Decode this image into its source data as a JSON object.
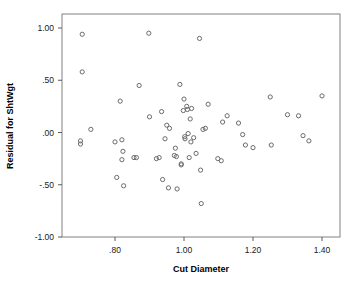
{
  "chart_data": {
    "type": "scatter",
    "title": "",
    "xlabel": "Cut Diameter",
    "ylabel": "Residual for ShtWgt",
    "xlim": [
      0.685,
      1.43
    ],
    "ylim": [
      -1.0,
      1.08
    ],
    "grid": false,
    "legend": null,
    "xticks": [
      0.8,
      1.0,
      1.2,
      1.4
    ],
    "xticklabels": [
      ".80",
      "1.00",
      "1.20",
      "1.40"
    ],
    "yticks": [
      1.0,
      0.5,
      0.0,
      -0.5,
      -1.0
    ],
    "yticklabels": [
      "1.00",
      ".50",
      ".00",
      "-.50",
      "-1.00"
    ],
    "marker": "open-circle",
    "marker_color": "#6b6b6b",
    "points": [
      [
        0.705,
        0.94
      ],
      [
        0.705,
        0.58
      ],
      [
        0.7,
        -0.08
      ],
      [
        0.7,
        -0.11
      ],
      [
        0.73,
        0.03
      ],
      [
        0.8,
        -0.09
      ],
      [
        0.805,
        -0.43
      ],
      [
        0.815,
        0.3
      ],
      [
        0.82,
        -0.07
      ],
      [
        0.82,
        -0.26
      ],
      [
        0.823,
        -0.18
      ],
      [
        0.825,
        -0.51
      ],
      [
        0.855,
        -0.24
      ],
      [
        0.862,
        -0.24
      ],
      [
        0.87,
        0.45
      ],
      [
        0.898,
        0.95
      ],
      [
        0.9,
        0.15
      ],
      [
        0.92,
        -0.25
      ],
      [
        0.928,
        -0.24
      ],
      [
        0.935,
        0.2
      ],
      [
        0.938,
        -0.45
      ],
      [
        0.945,
        -0.06
      ],
      [
        0.95,
        0.07
      ],
      [
        0.955,
        -0.53
      ],
      [
        0.958,
        0.04
      ],
      [
        0.972,
        -0.22
      ],
      [
        0.975,
        -0.15
      ],
      [
        0.978,
        -0.23
      ],
      [
        0.98,
        -0.54
      ],
      [
        0.988,
        0.46
      ],
      [
        0.992,
        -0.3
      ],
      [
        0.992,
        -0.31
      ],
      [
        0.998,
        0.21
      ],
      [
        1.0,
        0.32
      ],
      [
        1.002,
        -0.04
      ],
      [
        1.003,
        -0.06
      ],
      [
        1.008,
        0.25
      ],
      [
        1.01,
        0.22
      ],
      [
        1.012,
        -0.01
      ],
      [
        1.015,
        -0.24
      ],
      [
        1.018,
        0.13
      ],
      [
        1.02,
        -0.09
      ],
      [
        1.022,
        0.23
      ],
      [
        1.028,
        -0.05
      ],
      [
        1.035,
        -0.2
      ],
      [
        1.045,
        0.9
      ],
      [
        1.048,
        -0.36
      ],
      [
        1.05,
        -0.68
      ],
      [
        1.055,
        0.03
      ],
      [
        1.062,
        0.04
      ],
      [
        1.07,
        0.27
      ],
      [
        1.098,
        -0.25
      ],
      [
        1.108,
        -0.27
      ],
      [
        1.112,
        0.1
      ],
      [
        1.125,
        0.16
      ],
      [
        1.158,
        0.09
      ],
      [
        1.17,
        -0.02
      ],
      [
        1.178,
        -0.12
      ],
      [
        1.2,
        -0.145
      ],
      [
        1.25,
        0.34
      ],
      [
        1.253,
        -0.12
      ],
      [
        1.3,
        0.17
      ],
      [
        1.332,
        0.16
      ],
      [
        1.345,
        -0.03
      ],
      [
        1.362,
        -0.08
      ],
      [
        1.4,
        0.35
      ]
    ]
  },
  "chart": {
    "xlabel": "Cut Diameter",
    "ylabel": "Residual for ShtWgt"
  }
}
